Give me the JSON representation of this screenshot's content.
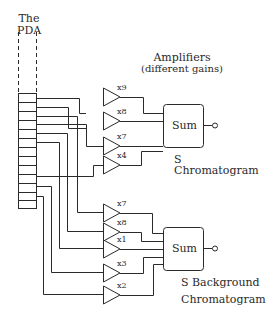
{
  "diagram": {
    "pda": {
      "title_line1": "The",
      "title_line2": "PDA",
      "cell_count": 13
    },
    "amplifiers": {
      "title_line1": "Amplifiers",
      "title_line2": "(different gains)"
    },
    "groups": [
      {
        "name": "signal",
        "gains": [
          "x9",
          "x8",
          "x7",
          "x4"
        ],
        "sum_label": "Sum",
        "output_label_line1": "S Chromatogram",
        "output_label_line2": ""
      },
      {
        "name": "background",
        "gains": [
          "x7",
          "x8",
          "x1",
          "x3",
          "x2"
        ],
        "sum_label": "Sum",
        "output_label_line1": "S Background",
        "output_label_line2": "Chromatogram"
      }
    ],
    "colors": {
      "line": "#2a2a2a",
      "background": "#ffffff"
    }
  }
}
